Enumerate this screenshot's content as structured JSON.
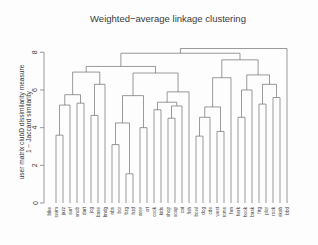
{
  "figure": {
    "title": "Weighted−average linkage clustering",
    "ylabel_line1": "user matrix clubD dissimilarity measure",
    "ylabel_line2": "1 − Jaccard similarity",
    "background_color": "#fdfdfd",
    "line_color": "#6e6e6e",
    "text_color": "#3a3a3a"
  },
  "axis": {
    "ticks": [
      "0",
      "2",
      "4",
      "6",
      "8"
    ],
    "tick_values": [
      0,
      2,
      4,
      6,
      8
    ],
    "range": [
      0,
      8.6
    ]
  },
  "chart_data": {
    "type": "dendrogram",
    "title": "Weighted−average linkage clustering",
    "xlabel": "",
    "ylabel": "user matrix clubD dissimilarity measure 1 − Jaccard similarity",
    "ylim": [
      0,
      8.6
    ],
    "yticks": [
      0,
      2,
      4,
      6,
      8
    ],
    "grid": false,
    "legend": false,
    "leaf_order": [
      "bike",
      "swim",
      "jazz",
      "surf",
      "snob",
      "dart",
      "jog",
      "base",
      "bndg",
      "nbs",
      "bcr",
      "bzg",
      "hzd",
      "arev",
      "crt",
      "cook",
      "kids",
      "shop",
      "soap",
      "cat",
      "fish",
      "bowl",
      "dog",
      "cde",
      "west",
      "roms",
      "hrn",
      "herk",
      "hook",
      "bask",
      "frtg",
      "plor",
      "rock",
      "ekah",
      "bbd"
    ],
    "merges": [
      {
        "left": "bike",
        "right": "C1",
        "height": 6.1
      },
      {
        "left": "swim",
        "right": "jazz",
        "height": 3.6
      },
      {
        "left": "C2",
        "right": "surf",
        "height": 5.2
      },
      {
        "left": "snob",
        "right": "dart",
        "height": 5.3
      },
      {
        "left": "C3",
        "right": "C4",
        "height": 5.75
      },
      {
        "left": "jog",
        "right": "base",
        "height": 4.65
      },
      {
        "left": "C6",
        "right": "bndg",
        "height": 6.3
      },
      {
        "left": "C5",
        "right": "C7",
        "height": 6.95
      },
      {
        "left": "nbs",
        "right": "bcr",
        "height": 3.1
      },
      {
        "left": "bzg",
        "right": "hzd",
        "height": 1.55
      },
      {
        "left": "C9",
        "right": "C10",
        "height": 4.25
      },
      {
        "left": "arev",
        "right": "crt",
        "height": 4.0
      },
      {
        "left": "C11",
        "right": "C12",
        "height": 5.7
      },
      {
        "left": "cook",
        "right": "kids",
        "height": 4.95
      },
      {
        "left": "shop",
        "right": "soap",
        "height": 4.5
      },
      {
        "left": "C15",
        "right": "cat",
        "height": 5.15
      },
      {
        "left": "C14",
        "right": "C16",
        "height": 5.35
      },
      {
        "left": "C17",
        "right": "fish",
        "height": 5.9
      },
      {
        "left": "C13",
        "right": "C18",
        "height": 6.9
      },
      {
        "left": "C8",
        "right": "C19",
        "height": 7.25
      },
      {
        "left": "bowl",
        "right": "dog",
        "height": 3.55
      },
      {
        "left": "C21",
        "right": "cde",
        "height": 4.55
      },
      {
        "left": "west",
        "right": "roms",
        "height": 3.8
      },
      {
        "left": "C22",
        "right": "C23",
        "height": 5.1
      },
      {
        "left": "C24",
        "right": "hrn",
        "height": 6.65
      },
      {
        "left": "herk",
        "right": "hook",
        "height": 4.55
      },
      {
        "left": "C26",
        "right": "bask",
        "height": 6.0
      },
      {
        "left": "frtg",
        "right": "plor",
        "height": 5.25
      },
      {
        "left": "rock",
        "right": "ekah",
        "height": 5.6
      },
      {
        "left": "C28",
        "right": "C29",
        "height": 6.3
      },
      {
        "left": "C27",
        "right": "C30",
        "height": 6.8
      },
      {
        "left": "C25",
        "right": "C31",
        "height": 7.6
      },
      {
        "left": "C20",
        "right": "C32",
        "height": 7.95
      },
      {
        "left": "C33",
        "right": "bbd",
        "height": 8.2
      }
    ]
  }
}
